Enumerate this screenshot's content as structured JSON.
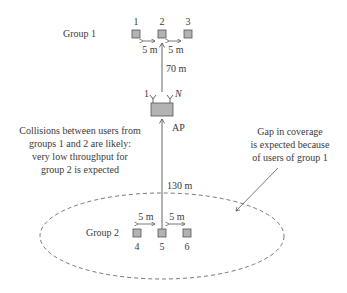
{
  "diagram": {
    "group1": {
      "label": "Group 1",
      "users": [
        "1",
        "2",
        "3"
      ],
      "spacing_left": "5 m",
      "spacing_right": "5 m",
      "distance_to_ap": "70 m"
    },
    "ap": {
      "label": "AP",
      "antenna_first": "1",
      "antenna_last": "N"
    },
    "group2": {
      "label": "Group 2",
      "users": [
        "4",
        "5",
        "6"
      ],
      "spacing_left": "5 m",
      "spacing_right": "5 m",
      "distance_to_ap": "130 m"
    },
    "annotations": {
      "collisions": [
        "Collisions between users from",
        "groups 1 and 2 are likely:",
        "very low throughput for",
        "group 2 is expected"
      ],
      "gap": [
        "Gap in coverage",
        "is expected because",
        "of users of group 1"
      ]
    },
    "colors": {
      "user_box_fill": "#b3b3b3",
      "user_box_stroke": "#555555",
      "line": "#555555",
      "coverage_ellipse": "#555555"
    }
  }
}
